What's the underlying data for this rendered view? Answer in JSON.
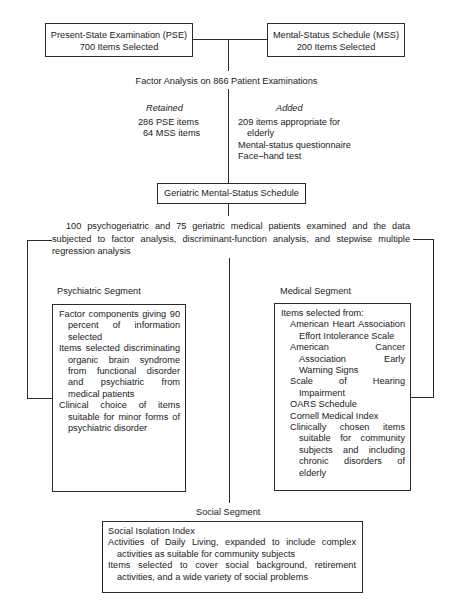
{
  "pse": {
    "title": "Present-State Examination (PSE)",
    "count": "700 Items Selected"
  },
  "mss": {
    "title": "Mental-Status Schedule (MSS)",
    "count": "200 Items Selected"
  },
  "factor_analysis": "Factor Analysis on 866 Patient Examinations",
  "retained": {
    "heading": "Retained",
    "items": [
      "286 PSE items",
      "64 MSS items"
    ]
  },
  "added": {
    "heading": "Added",
    "items": [
      "209 items appropriate for elderly",
      "Mental-status questionnaire",
      "Face–hand test"
    ]
  },
  "gmss": {
    "title": "Geriatric Mental-Status Schedule"
  },
  "study": {
    "text": "100 psychogeriatric and 75 geriatric medical patients examined and the data subjected to factor analysis, discriminant-function analysis, and stepwise multiple regression analysis"
  },
  "psychiatric": {
    "heading": "Psychiatric Segment",
    "items": [
      "Factor components giving 90 percent of information selected",
      "Items selected discriminating organic brain syndrome from functional disorder and psychiatric from medical patients",
      "Clinical choice of items suitable for minor forms of psychiatric disorder"
    ]
  },
  "medical": {
    "heading": "Medical Segment",
    "intro": "Items selected from:",
    "sources": [
      "American Heart Association Effort Intolerance Scale",
      "American Cancer Association Early Warning Signs",
      "Scale of Hearing Impairment",
      "OARS Schedule",
      "Cornell Medical Index",
      "Clinically chosen items suitable for community subjects and including chronic disorders of elderly"
    ]
  },
  "social": {
    "heading": "Social Segment",
    "items": [
      "Social Isolation Index",
      "Activities of Daily Living, expanded to include complex activities as suitable for community subjects",
      "Items selected to cover social background, retirement activities, and a wide variety of social problems"
    ]
  }
}
